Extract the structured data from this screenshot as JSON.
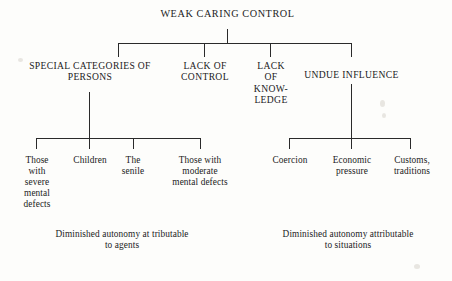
{
  "diagram": {
    "type": "tree",
    "title": "WEAK CARING CONTROL",
    "level1": [
      {
        "label": "SPECIAL CATEGORIES OF\nPERSONS"
      },
      {
        "label": "LACK OF\nCONTROL"
      },
      {
        "label": "LACK\nOF\nKNOW-\nLEDGE"
      },
      {
        "label": "UNDUE INFLUENCE"
      }
    ],
    "leaves_left": [
      {
        "label": "Those\nwith\nsevere\nmental\ndefects"
      },
      {
        "label": "Children"
      },
      {
        "label": "The\nsenile"
      },
      {
        "label": "Those with\nmoderate\nmental defects"
      }
    ],
    "leaves_right": [
      {
        "label": "Coercion"
      },
      {
        "label": "Economic\npressure"
      },
      {
        "label": "Customs,\ntraditions"
      }
    ],
    "captions": [
      {
        "label": "Diminished autonomy at tributable\nto agents"
      },
      {
        "label": "Diminished autonomy attributable\nto situations"
      }
    ],
    "colors": {
      "line": "#2a2a2a",
      "text": "#1b1b1b",
      "background": "#fdfdfb"
    }
  }
}
